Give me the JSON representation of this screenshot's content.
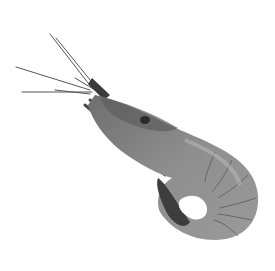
{
  "image": {
    "subject": "shrimp",
    "style": "grayscale photograph",
    "background_color": "#ffffff",
    "body_color": "#8a8a8a",
    "dark_color": "#3a3a3a",
    "light_color": "#b5b5b5"
  }
}
